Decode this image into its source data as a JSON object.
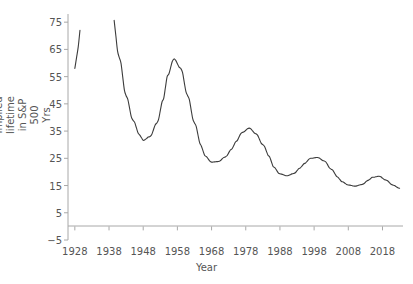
{
  "chart_data": {
    "type": "line",
    "title": "",
    "xlabel": "Year",
    "ylabel": "Implied lifetime in S&P 500",
    "ylabel_line2": "Yrs",
    "xlim": [
      1926,
      2024
    ],
    "ylim": [
      -5,
      78
    ],
    "grid": false,
    "legend": null,
    "yticks": [
      75,
      65,
      55,
      45,
      35,
      25,
      15,
      5,
      -5
    ],
    "ytick_labels": [
      "75",
      "65",
      "55",
      "45",
      "35",
      "25",
      "15",
      "5",
      "−5"
    ],
    "xticks": [
      1928,
      1938,
      1948,
      1958,
      1968,
      1978,
      1988,
      1998,
      2008,
      2018
    ],
    "xtick_labels": [
      "1928",
      "1938",
      "1948",
      "1958",
      "1968",
      "1978",
      "1988",
      "1998",
      "2008",
      "2018"
    ],
    "zero_line": 0,
    "line_color": "#3c3c3c",
    "axis_color": "#a8a8a8",
    "text_color": "#555555",
    "note": "Curve exceeds the top of the axis between approximately 1930 and 1939, producing a visible break.",
    "series": [
      {
        "name": "Implied lifetime in S&P 500",
        "x": [
          1928,
          1929,
          1930,
          1939,
          1941,
          1943,
          1945,
          1947,
          1948,
          1950,
          1952,
          1954,
          1955,
          1957,
          1959,
          1961,
          1963,
          1965,
          1966,
          1968,
          1970,
          1972,
          1974,
          1975,
          1977,
          1979,
          1981,
          1983,
          1985,
          1986,
          1988,
          1990,
          1992,
          1994,
          1995,
          1997,
          1999,
          2001,
          2003,
          2005,
          2006,
          2008,
          2010,
          2012,
          2014,
          2015,
          2017,
          2019,
          2021,
          2023
        ],
        "y": [
          58.0,
          66.0,
          78.0,
          78.0,
          62.0,
          48.0,
          39.0,
          33.5,
          31.6,
          33.0,
          38.0,
          47.0,
          55.0,
          61.5,
          58.0,
          48.0,
          38.0,
          29.5,
          26.0,
          23.6,
          23.8,
          25.5,
          28.5,
          31.0,
          34.5,
          36.1,
          34.0,
          30.0,
          25.5,
          22.0,
          19.3,
          18.6,
          19.4,
          21.5,
          23.0,
          25.0,
          25.3,
          24.0,
          21.0,
          18.0,
          16.5,
          15.2,
          14.8,
          15.4,
          17.0,
          18.0,
          18.4,
          17.0,
          15.2,
          14.0
        ]
      }
    ]
  }
}
